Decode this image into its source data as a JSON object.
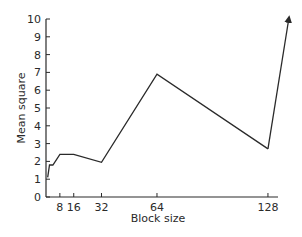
{
  "chart_data": {
    "type": "line",
    "title": "",
    "xlabel": "Block size",
    "ylabel": "Mean square",
    "xlim": [
      0,
      134
    ],
    "ylim": [
      0,
      10
    ],
    "grid": false,
    "legend": null,
    "x_ticks": [
      8,
      16,
      32,
      64,
      128
    ],
    "x_tick_labels": [
      "8",
      "16",
      "32",
      "64",
      "128"
    ],
    "y_ticks": [
      0,
      1,
      2,
      3,
      4,
      5,
      6,
      7,
      8,
      9,
      10
    ],
    "y_tick_labels": [
      "0",
      "1",
      "2",
      "3",
      "4",
      "5",
      "6",
      "7",
      "8",
      "9",
      "10"
    ],
    "series": [
      {
        "name": "Mean square",
        "x": [
          1,
          2,
          4,
          8,
          16,
          32,
          64,
          128
        ],
        "values": [
          1.1,
          1.8,
          1.8,
          2.4,
          2.4,
          1.95,
          6.9,
          2.7
        ]
      }
    ],
    "annotations": [
      {
        "type": "arrow",
        "from": [
          128,
          2.7
        ],
        "to": [
          140,
          10
        ],
        "note": "line continues off scale beyond 10"
      }
    ]
  },
  "layout": {
    "origin_px": [
      46,
      197
    ],
    "x_px_per_unit": 1.734,
    "y_px_per_unit": 17.8,
    "x_axis_end_px": 278,
    "y_axis_top_px": 19,
    "line_color": "#2a2a2a"
  }
}
